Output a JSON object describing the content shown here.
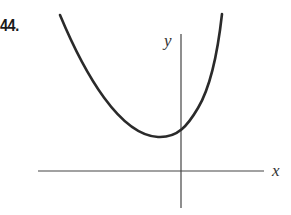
{
  "problem": {
    "number": "44."
  },
  "graph": {
    "x_axis_label": "x",
    "y_axis_label": "y",
    "curve_description": "Upward-opening parabola with vertex left of the y-axis and above the x-axis; y-intercept positive",
    "colors": {
      "curve": "#2a2a2a",
      "axes": "#444444",
      "background": "#ffffff"
    }
  }
}
